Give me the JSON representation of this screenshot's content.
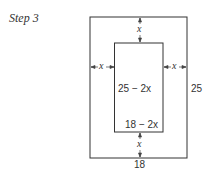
{
  "title": "Step 3",
  "diagram": {
    "outer_width_label": "18",
    "outer_height_label": "25",
    "inner_height_label": "25 − 2x",
    "inner_width_label": "18 − 2x",
    "margin_label": "x"
  }
}
